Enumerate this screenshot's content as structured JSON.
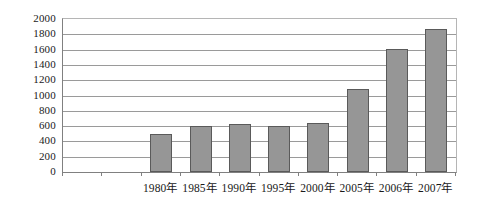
{
  "chart_data": {
    "type": "bar",
    "title": "",
    "subtitle": "",
    "xlabel": "",
    "ylabel": "",
    "categories": [
      "",
      "",
      "1980年",
      "1985年",
      "1990年",
      "1995年",
      "2000年",
      "2005年",
      "2006年",
      "2007年"
    ],
    "values": [
      null,
      null,
      500,
      600,
      630,
      600,
      640,
      1090,
      1610,
      1870
    ],
    "ylim": [
      0,
      2000
    ],
    "ytick_step": 200,
    "ytick_labels": [
      "2000",
      "1800",
      "1600",
      "1400",
      "1200",
      "1000",
      "800",
      "600",
      "400",
      "200",
      "0"
    ],
    "grid": true,
    "grid_axis": "y",
    "legend": false,
    "legend_position": "none",
    "bar_color": "#969696",
    "bar_border_color": "#5a5a5a",
    "grid_color": "#9a9a9a",
    "axis_color": "#808080",
    "plot_background": "#ffffff",
    "series": [
      {
        "name": "",
        "points": [
          {
            "category": "",
            "value": null
          },
          {
            "category": "",
            "value": null
          },
          {
            "category": "1980年",
            "value": 500
          },
          {
            "category": "1985年",
            "value": 600
          },
          {
            "category": "1990年",
            "value": 630
          },
          {
            "category": "1995年",
            "value": 600
          },
          {
            "category": "2000年",
            "value": 640
          },
          {
            "category": "2005年",
            "value": 1090
          },
          {
            "category": "2006年",
            "value": 1610
          },
          {
            "category": "2007年",
            "value": 1870
          }
        ]
      }
    ]
  }
}
